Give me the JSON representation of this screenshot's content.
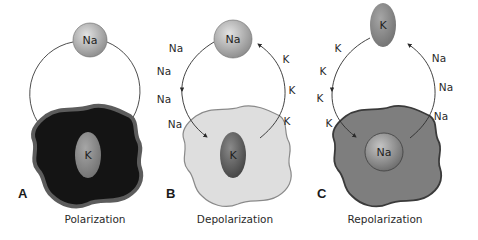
{
  "panels": [
    {
      "letter": "A",
      "caption": "Polarization",
      "top_ion": "Na",
      "inner_ion": "K",
      "left_labels": [],
      "right_labels": [],
      "cell_color": "#141414",
      "cell_edge": "#5a5a5a"
    },
    {
      "letter": "B",
      "caption": "Depolarization",
      "top_ion": "Na",
      "inner_ion": "K",
      "left_labels": [
        "Na",
        "Na",
        "Na",
        "Na"
      ],
      "right_labels": [
        "K",
        "K",
        "K"
      ],
      "cell_color": "#dcdcdc",
      "cell_edge": "#8a8a8a"
    },
    {
      "letter": "C",
      "caption": "Repolarization",
      "top_ion": "K",
      "inner_ion": "Na",
      "left_labels": [
        "K",
        "K",
        "K",
        "K"
      ],
      "right_labels": [
        "Na",
        "Na",
        "Na"
      ],
      "cell_color": "#7e7e7e",
      "cell_edge": "#3a3a3a"
    }
  ],
  "colors": {
    "sphere_light": "#d8d8d8",
    "sphere_dark": "#8c8c8c",
    "k_dark": "#555555",
    "k_light": "#8a8a8a",
    "line": "#3a3a3a"
  }
}
